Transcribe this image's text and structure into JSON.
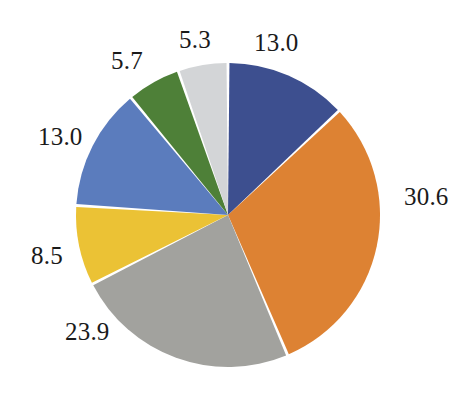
{
  "chart_data": {
    "type": "pie",
    "title": "",
    "subtitle": "",
    "xlabel": "",
    "ylabel": "",
    "legend": "none",
    "grid": false,
    "start_angle_deg": 0,
    "direction": "clockwise",
    "total": 100.0,
    "categories": [
      "Slice 1",
      "Slice 2",
      "Slice 3",
      "Slice 4",
      "Slice 5",
      "Slice 6",
      "Slice 7"
    ],
    "values": [
      13.0,
      30.6,
      23.9,
      8.5,
      13.0,
      5.7,
      5.3
    ],
    "labels": [
      "13.0",
      "30.6",
      "23.9",
      "8.5",
      "13.0",
      "5.7",
      "5.3"
    ],
    "colors": [
      "#3d4f8f",
      "#dd8233",
      "#a2a29e",
      "#ebc235",
      "#5b7cbd",
      "#4e8038",
      "#d3d5d7"
    ],
    "slice_gap_color": "#ffffff",
    "background": "#ffffff",
    "label_color": "#1a1a1a"
  },
  "geometry": {
    "center_x": 228,
    "center_y": 215,
    "radius": 152
  },
  "slices": [
    {
      "value": 13.0,
      "label": "13.0",
      "color": "#3d4f8f",
      "name": "slice-navy",
      "label_x": 254,
      "label_y": 30
    },
    {
      "value": 30.6,
      "label": "30.6",
      "color": "#dd8233",
      "name": "slice-orange",
      "label_x": 404,
      "label_y": 184
    },
    {
      "value": 23.9,
      "label": "23.9",
      "color": "#a2a29e",
      "name": "slice-gray",
      "label_x": 65,
      "label_y": 319
    },
    {
      "value": 8.5,
      "label": "8.5",
      "color": "#ebc235",
      "name": "slice-yellow",
      "label_x": 31,
      "label_y": 243
    },
    {
      "value": 13.0,
      "label": "13.0",
      "color": "#5b7cbd",
      "name": "slice-blue",
      "label_x": 38,
      "label_y": 124
    },
    {
      "value": 5.7,
      "label": "5.7",
      "color": "#4e8038",
      "name": "slice-green",
      "label_x": 111,
      "label_y": 48
    },
    {
      "value": 5.3,
      "label": "5.3",
      "color": "#d3d5d7",
      "name": "slice-lightgray",
      "label_x": 179,
      "label_y": 27
    }
  ]
}
